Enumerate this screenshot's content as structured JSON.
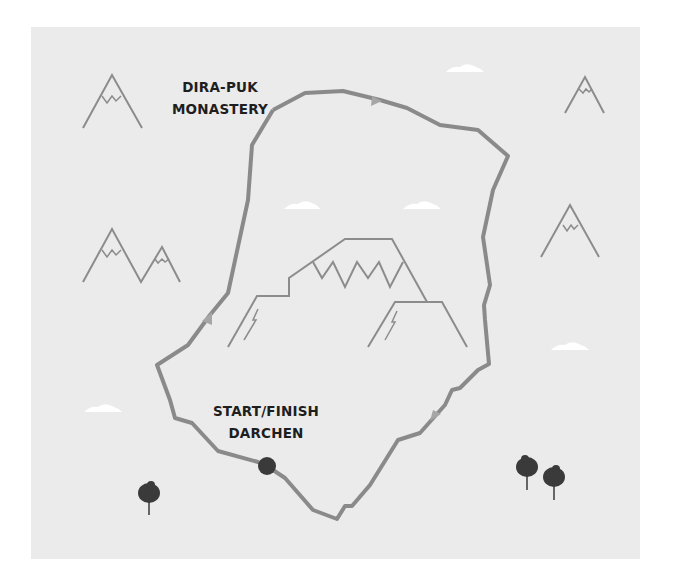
{
  "map": {
    "background_color": "#ebebeb",
    "route_color": "#8a8a8a",
    "mountain_color": "#8c8c8c",
    "marker_color": "#3a3a3a",
    "cloud_color": "#ffffff"
  },
  "labels": {
    "monastery": {
      "line1": "DIRA-PUK",
      "line2": "MONASTERY"
    },
    "start": {
      "line1": "START/FINISH",
      "line2": "DARCHEN"
    }
  },
  "route": {
    "name": "kora-loop",
    "direction": "clockwise",
    "direction_arrows": 3
  },
  "icons": {
    "mountains": 6,
    "central_mountain": "mount-kailash",
    "clouds": 6,
    "trees": 3,
    "start_marker": "filled-circle"
  }
}
